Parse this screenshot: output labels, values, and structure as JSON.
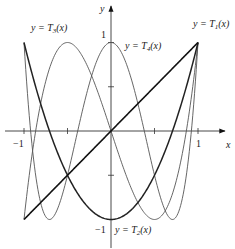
{
  "chart_data": {
    "type": "line",
    "title": "",
    "xlabel": "x",
    "ylabel": "y",
    "xlim": [
      -1.1,
      1.3
    ],
    "ylim": [
      -1.3,
      1.4
    ],
    "grid": false,
    "x_ticks": [
      -1,
      -0.5,
      0,
      0.5,
      1
    ],
    "y_ticks": [
      -1,
      -0.5,
      0,
      0.5,
      1
    ],
    "x_tick_labels": [
      {
        "value": -1,
        "label": "−1"
      },
      {
        "value": 1,
        "label": "1"
      }
    ],
    "y_tick_labels": [
      {
        "value": 1,
        "label": "1"
      },
      {
        "value": -1,
        "label": "−1"
      }
    ],
    "domain": [
      -1,
      1
    ],
    "series": [
      {
        "name": "y = T1(x)",
        "formula": "x",
        "label_prefix": "y = T",
        "label_sub": "1",
        "label_suffix": "(x)",
        "color": "#111111",
        "width": 1.6
      },
      {
        "name": "y = T2(x)",
        "formula": "2x^2 - 1",
        "label_prefix": "y = T",
        "label_sub": "2",
        "label_suffix": "(x)",
        "color": "#222222",
        "width": 1.5
      },
      {
        "name": "y = T3(x)",
        "formula": "4x^3 - 3x",
        "label_prefix": "y = T",
        "label_sub": "3",
        "label_suffix": "(x)",
        "color": "#555555",
        "width": 0.9
      },
      {
        "name": "y = T4(x)",
        "formula": "8x^4 - 8x^2 + 1",
        "label_prefix": "y = T",
        "label_sub": "4",
        "label_suffix": "(x)",
        "color": "#555555",
        "width": 0.9
      }
    ],
    "annotations": [
      {
        "text": "y = T1(x)",
        "near": [
          1,
          1
        ]
      },
      {
        "text": "y = T2(x)",
        "near": [
          0,
          -1
        ]
      },
      {
        "text": "y = T3(x)",
        "near": [
          -1,
          -1
        ]
      },
      {
        "text": "y = T4(x)",
        "near": [
          0.15,
          1
        ]
      }
    ]
  },
  "axes": {
    "x_label": "x",
    "y_label": "y",
    "tick_x_neg1": "−1",
    "tick_x_1": "1",
    "tick_y_1": "1",
    "tick_y_neg1": "−1"
  },
  "labels": {
    "t1": {
      "prefix": "y = T",
      "sub": "1",
      "suffix": "(x)"
    },
    "t2": {
      "prefix": "y = T",
      "sub": "2",
      "suffix": "(x)"
    },
    "t3": {
      "prefix": "y = T",
      "sub": "3",
      "suffix": "(x)"
    },
    "t4": {
      "prefix": "y = T",
      "sub": "4",
      "suffix": "(x)"
    }
  }
}
